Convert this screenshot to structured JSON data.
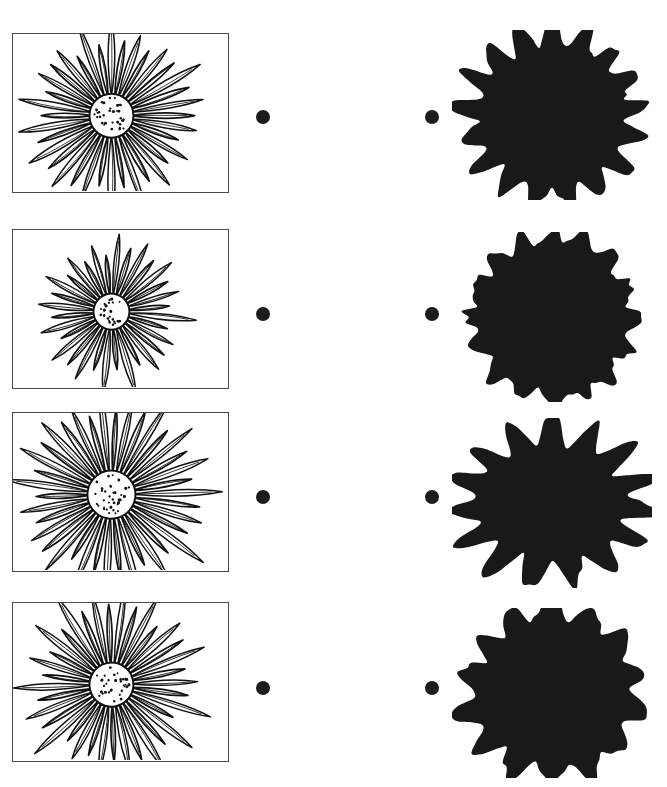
{
  "document": {
    "title": "Flower Outline and Silhouette Comparison Sheet",
    "background_color": "#ffffff",
    "width": 667,
    "height": 787,
    "ink_color": "#1c1c1c",
    "frame_border_color": "#4a4a4a",
    "silhouette_color": "#191919"
  },
  "layout": {
    "row_count": 4,
    "columns": [
      {
        "name": "outline-panel",
        "label": "Line drawing in frame"
      },
      {
        "name": "left-bullet",
        "label": "Bullet marker"
      },
      {
        "name": "right-bullet",
        "label": "Bullet marker"
      },
      {
        "name": "silhouette-panel",
        "label": "Black silhouette"
      }
    ],
    "frame_x": 12,
    "frame_width": 217,
    "frame_height": 160,
    "bullet_left_cx": 263,
    "bullet_right_cx": 432,
    "bullet_radius": 7,
    "silhouette_x": 452,
    "silhouette_width": 200
  },
  "rows": [
    {
      "index": 1,
      "frame_top": 33,
      "bullet_cy": 117,
      "outline": {
        "name": "dahlia-outline",
        "description": "Dense many-petalled dahlia bloom, frontal view with stippled round center",
        "petal_count": 18,
        "center_dot_count": 32,
        "center_radius": 22,
        "rotation_deg": 0
      },
      "silhouette": {
        "name": "dahlia-silhouette",
        "description": "Star-like solid black blob with pointed petal lobes, wider than tall",
        "lobe_count": 17,
        "seed": 11,
        "radius_x": 86,
        "radius_y": 82,
        "spike": 0.3,
        "top": 30
      }
    },
    {
      "index": 2,
      "frame_top": 229,
      "bullet_cy": 314,
      "outline": {
        "name": "open-dahlia-outline",
        "description": "Tilted half-open dahlia with loose drooping petals and off-center stippled disc",
        "petal_count": 16,
        "center_dot_count": 24,
        "center_radius": 18,
        "rotation_deg": -28
      },
      "silhouette": {
        "name": "open-dahlia-silhouette",
        "description": "Rounded, scalloped solid black blob with shallow bumps",
        "lobe_count": 16,
        "seed": 27,
        "radius_x": 82,
        "radius_y": 82,
        "spike": 0.16,
        "top": 232
      }
    },
    {
      "index": 3,
      "frame_top": 412,
      "bullet_cy": 497,
      "outline": {
        "name": "daisy-outline",
        "description": "Broad daisy with long radiating petals and large stippled center disc",
        "petal_count": 19,
        "center_dot_count": 34,
        "center_radius": 24,
        "rotation_deg": 8
      },
      "silhouette": {
        "name": "daisy-silhouette",
        "description": "Wide irregular solid black blob with long jagged spikes to the right and below",
        "lobe_count": 15,
        "seed": 43,
        "radius_x": 92,
        "radius_y": 72,
        "spike": 0.4,
        "top": 418
      }
    },
    {
      "index": 4,
      "frame_top": 602,
      "bullet_cy": 688,
      "outline": {
        "name": "daisy-tilted-outline",
        "description": "Daisy tilted slightly left with overlapping petals and stippled center disc",
        "petal_count": 18,
        "center_dot_count": 30,
        "center_radius": 22,
        "rotation_deg": -12
      },
      "silhouette": {
        "name": "daisy-tilted-silhouette",
        "description": "Chunky solid black blob with broad rounded lobes and a flared right side",
        "lobe_count": 14,
        "seed": 61,
        "radius_x": 88,
        "radius_y": 84,
        "spike": 0.26,
        "top": 608
      }
    }
  ]
}
